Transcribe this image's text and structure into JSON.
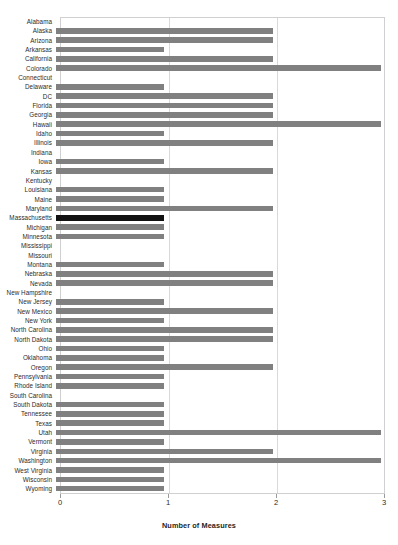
{
  "chart_data": {
    "type": "bar",
    "orientation": "horizontal",
    "title": "",
    "xlabel": "Number of Measures",
    "ylabel": "",
    "xlim": [
      0,
      3
    ],
    "xticks": [
      0,
      1,
      2,
      3
    ],
    "xtick_labels": [
      "0",
      "1",
      "2",
      "3"
    ],
    "grid": "vertical",
    "legend": "none",
    "bar_color": "#808080",
    "highlight_color": "#111111",
    "highlight_category": "Massachusetts",
    "categories": [
      "Alabama",
      "Alaska",
      "Arizona",
      "Arkansas",
      "California",
      "Colorado",
      "Connecticut",
      "Delaware",
      "DC",
      "Florida",
      "Georgia",
      "Hawaii",
      "Idaho",
      "Illinois",
      "Indiana",
      "Iowa",
      "Kansas",
      "Kentucky",
      "Louisiana",
      "Maine",
      "Maryland",
      "Massachusetts",
      "Michigan",
      "Minnesota",
      "Mississippi",
      "Missouri",
      "Montana",
      "Nebraska",
      "Nevada",
      "New Hampshire",
      "New Jersey",
      "New Mexico",
      "New York",
      "North Carolina",
      "North Dakota",
      "Ohio",
      "Oklahoma",
      "Oregon",
      "Pennsylvania",
      "Rhode Island",
      "South Carolina",
      "South Dakota",
      "Tennessee",
      "Texas",
      "Utah",
      "Vermont",
      "Virginia",
      "Washington",
      "West Virginia",
      "Wisconsin",
      "Wyoming"
    ],
    "values": [
      0,
      2,
      2,
      1,
      2,
      3,
      0,
      1,
      2,
      2,
      2,
      3,
      1,
      2,
      0,
      1,
      2,
      0,
      1,
      1,
      2,
      1,
      1,
      1,
      0,
      0,
      1,
      2,
      2,
      0,
      1,
      2,
      1,
      2,
      2,
      1,
      1,
      2,
      1,
      1,
      0,
      1,
      1,
      1,
      3,
      1,
      2,
      3,
      1,
      1,
      1
    ]
  }
}
